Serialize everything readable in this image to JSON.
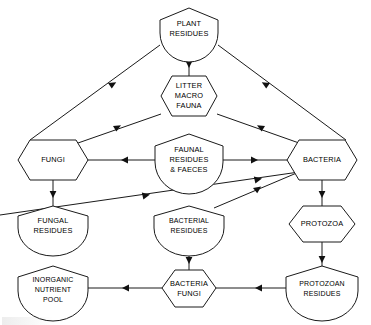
{
  "diagram": {
    "background_color": "#ffffff",
    "line_color": "#1a1a1a",
    "text_color": "#000000",
    "nodes": [
      {
        "id": "plant-residues",
        "shape": "shield",
        "lines": [
          "PLANT",
          "RESIDUES"
        ],
        "cx": 189,
        "cy": 28
      },
      {
        "id": "litter-macro-fauna",
        "shape": "hexagon",
        "lines": [
          "LITTER",
          "MACRO",
          "FAUNA"
        ],
        "cx": 189,
        "cy": 96
      },
      {
        "id": "fungi",
        "shape": "hexagon",
        "lines": [
          "FUNGI"
        ],
        "cx": 53,
        "cy": 160
      },
      {
        "id": "faunal-residues-faeces",
        "shape": "shield",
        "lines": [
          "FAUNAL",
          "RESIDUES",
          "& FAECES"
        ],
        "cx": 189,
        "cy": 158
      },
      {
        "id": "bacteria",
        "shape": "hexagon",
        "lines": [
          "BACTERIA"
        ],
        "cx": 322,
        "cy": 160
      },
      {
        "id": "fungal-residues",
        "shape": "shield",
        "lines": [
          "FUNGAL",
          "RESIDUES"
        ],
        "cx": 53,
        "cy": 224
      },
      {
        "id": "bacterial-residues",
        "shape": "shield",
        "lines": [
          "BACTERIAL",
          "RESIDUES"
        ],
        "cx": 189,
        "cy": 224
      },
      {
        "id": "protozoa",
        "shape": "hexagon",
        "lines": [
          "PROTOZOA"
        ],
        "cx": 322,
        "cy": 224
      },
      {
        "id": "inorganic-nutrient-pool",
        "shape": "shield",
        "lines": [
          "INORGANIC",
          "NUTRIENT",
          "POOL"
        ],
        "cx": 53,
        "cy": 288
      },
      {
        "id": "bacteria-fungi",
        "shape": "hexagon",
        "lines": [
          "BACTERIA",
          "FUNGI"
        ],
        "cx": 189,
        "cy": 288
      },
      {
        "id": "protozoan-residues",
        "shape": "shield",
        "lines": [
          "PROTOZOAN",
          "RESIDUES"
        ],
        "cx": 322,
        "cy": 288
      }
    ],
    "edges": [
      {
        "id": "plant-to-litter",
        "from": "plant-residues",
        "to": "litter-macro-fauna",
        "direction": "down"
      },
      {
        "id": "plant-to-fungi",
        "from": "plant-residues",
        "to": "fungi",
        "direction": "down-left"
      },
      {
        "id": "plant-to-bacteria",
        "from": "plant-residues",
        "to": "bacteria",
        "direction": "down-right"
      },
      {
        "id": "litter-to-fungi",
        "from": "litter-macro-fauna",
        "to": "fungi",
        "direction": "down-left"
      },
      {
        "id": "litter-to-bacteria",
        "from": "litter-macro-fauna",
        "to": "bacteria",
        "direction": "down-right"
      },
      {
        "id": "faunal-to-fungi",
        "from": "faunal-residues-faeces",
        "to": "fungi",
        "direction": "left"
      },
      {
        "id": "faunal-to-bacteria",
        "from": "faunal-residues-faeces",
        "to": "bacteria",
        "direction": "right"
      },
      {
        "id": "fungi-to-fungal-residues",
        "from": "fungi",
        "to": "fungal-residues",
        "direction": "down"
      },
      {
        "id": "fungal-residues-to-bacteria",
        "from": "fungal-residues",
        "to": "bacteria",
        "direction": "up-right"
      },
      {
        "id": "bacteria-to-bacterial-residues",
        "from": "bacteria",
        "to": "bacterial-residues",
        "direction": "down-left"
      },
      {
        "id": "bacteria-to-protozoa",
        "from": "bacteria",
        "to": "protozoa",
        "direction": "down"
      },
      {
        "id": "bacterial-residues-to-bacteria-fungi",
        "from": "bacterial-residues",
        "to": "bacteria-fungi",
        "direction": "down"
      },
      {
        "id": "protozoa-to-protozoan-residues",
        "from": "protozoa",
        "to": "protozoan-residues",
        "direction": "down"
      },
      {
        "id": "protozoan-residues-to-bacteria-fungi",
        "from": "protozoan-residues",
        "to": "bacteria-fungi",
        "direction": "left"
      },
      {
        "id": "bacteria-fungi-to-inorganic-pool",
        "from": "bacteria-fungi",
        "to": "inorganic-nutrient-pool",
        "direction": "left"
      }
    ]
  }
}
